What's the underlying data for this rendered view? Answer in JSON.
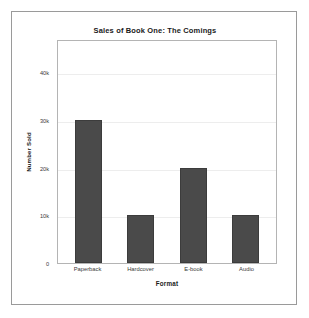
{
  "chart_data": {
    "type": "bar",
    "title": "Sales of Book One: The Comings",
    "xlabel": "Format",
    "ylabel": "Number Sold",
    "categories": [
      "Paperback",
      "Hardcover",
      "E-book",
      "Audio"
    ],
    "values": [
      30000,
      10000,
      20000,
      10000
    ],
    "ytick_labels": [
      "0",
      "10k",
      "20k",
      "30k",
      "40k"
    ],
    "ytick_values": [
      0,
      10000,
      20000,
      30000,
      40000
    ],
    "ylim": [
      0,
      47000
    ],
    "grid": true,
    "legend": false,
    "bar_color": "#4a4a4a",
    "bar_edge_color": "#3c3c3c",
    "gridline_color": "#ededed",
    "plot_border_color": "#b4b4b4",
    "page_border_color": "#9a9a9a",
    "background_color": "#ffffff",
    "text_color": "#1a1a1a"
  }
}
